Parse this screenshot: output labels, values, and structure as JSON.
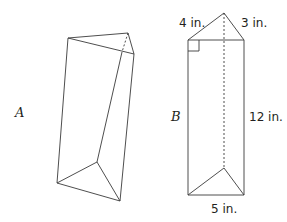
{
  "figure": {
    "prism_a": {
      "label": "A"
    },
    "prism_b": {
      "label": "B",
      "dimensions": {
        "leg_left": "4 in.",
        "leg_right": "3 in.",
        "height": "12 in.",
        "hypotenuse": "5 in."
      }
    }
  },
  "colors": {
    "stroke": "#3a3a3a",
    "text": "#231f20"
  }
}
